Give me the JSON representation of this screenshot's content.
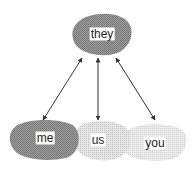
{
  "diagram": {
    "nodes": [
      {
        "id": "they",
        "label": "they",
        "x": 102,
        "y": 34,
        "shade": "dark"
      },
      {
        "id": "me",
        "label": "me",
        "x": 45,
        "y": 138,
        "shade": "dark"
      },
      {
        "id": "us",
        "label": "us",
        "x": 98,
        "y": 140,
        "shade": "light"
      },
      {
        "id": "you",
        "label": "you",
        "x": 155,
        "y": 143,
        "shade": "lighter"
      }
    ],
    "edges": [
      {
        "from": "they",
        "to": "me",
        "type": "bidirectional-arrow"
      },
      {
        "from": "they",
        "to": "us",
        "type": "bidirectional-arrow"
      },
      {
        "from": "they",
        "to": "you",
        "type": "bidirectional-arrow"
      }
    ],
    "colors": {
      "dark": "#8c8c8c",
      "light": "#d4d4d4",
      "lighter": "#e0e0e0",
      "arrow": "#333333"
    }
  }
}
